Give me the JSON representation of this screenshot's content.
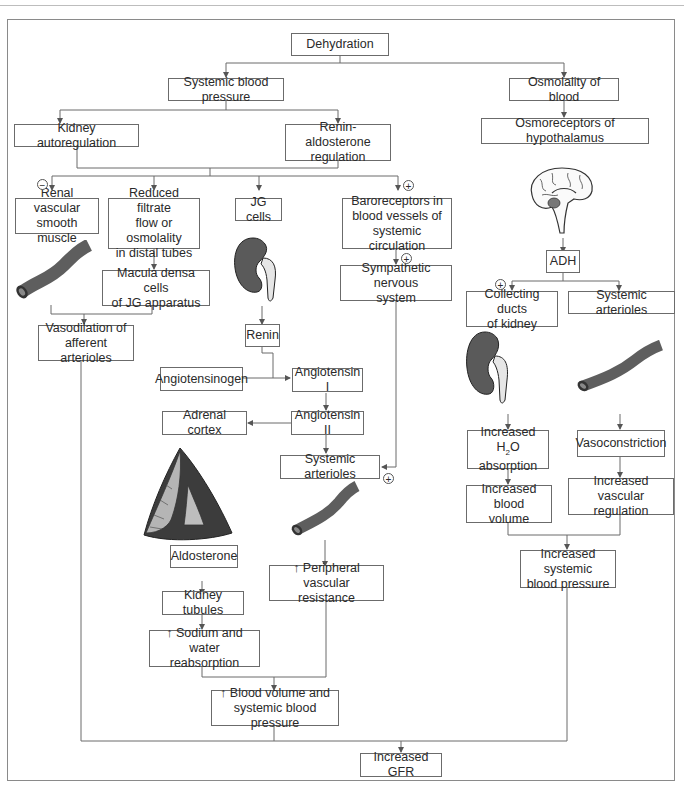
{
  "diagram": {
    "nodes": {
      "dehydration": "Dehydration",
      "systemic_bp": "Systemic blood pressure",
      "osmolality": "Osmolality of blood",
      "kidney_autoreg": "Kidney autoregulation",
      "renin_aldo": "Renin-aldosterone\nregulation",
      "osmoreceptors": "Osmoreceptors of hypothalamus",
      "renal_vsm": "Renal vascular\nsmooth muscle",
      "reduced_filtrate": "Reduced filtrate\nflow or osmolality\nin distal tubes",
      "jg_cells": "JG cells",
      "baroreceptors": "Baroreceptors in\nblood vessels of\nsystemic circulation",
      "macula_densa": "Macula densa cells\nof JG apparatus",
      "sympathetic": "Sympathetic nervous\nsystem",
      "adh": "ADH",
      "collecting_ducts": "Collecting ducts\nof kidney",
      "systemic_arterioles_r": "Systemic arterioles",
      "vasodilation": "Vasodilation of\nafferent arterioles",
      "renin": "Renin",
      "angiotensinogen": "Angiotensinogen",
      "angiotensin1": "Angiotensin I",
      "adrenal_cortex": "Adrenal cortex",
      "angiotensin2": "Angiotensin II",
      "systemic_arterioles_m": "Systemic arterioles",
      "increased_h2o_pre": "Increased H",
      "increased_h2o_sub": "2",
      "increased_h2o_post": "O\nabsorption",
      "vasoconstriction": "Vasoconstriction",
      "increased_blood_volume": "Increased blood\nvolume",
      "increased_vascular_reg": "Increased vascular\nregulation",
      "increased_systemic_bp": "Increased systemic\nblood pressure",
      "aldosterone": "Aldosterone",
      "peripheral_resistance": "↑ Peripheral vascular\nresistance",
      "kidney_tubules": "Kidney tubules",
      "sodium_water": "↑ Sodium and water\nreabsorption",
      "blood_volume_bp": "↑ Blood volume and\nsystemic blood pressure",
      "increased_gfr": "Increased GFR"
    },
    "signs": {
      "minus_renal": "−",
      "plus_baro": "+",
      "plus_symp": "+",
      "plus_collecting": "+",
      "plus_arterioles": "+"
    },
    "illustrations": [
      "blood-vessel",
      "kidney",
      "brain",
      "kidney",
      "blood-vessel",
      "adrenal-gland",
      "blood-vessel"
    ],
    "colors": {
      "line": "#6b6b6b",
      "organ": "#5a5a5a",
      "vessel": "#5e5e5e"
    }
  }
}
